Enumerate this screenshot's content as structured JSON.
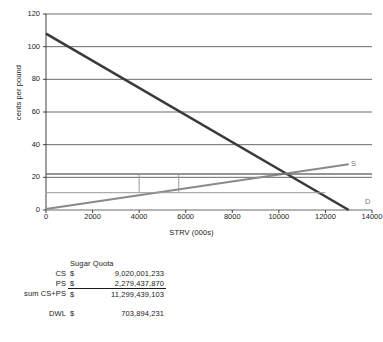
{
  "chart_data": {
    "type": "line",
    "title": "",
    "xlabel": "STRV (000s)",
    "ylabel": "cents per pound",
    "xlim": [
      0,
      14000
    ],
    "ylim": [
      0,
      120
    ],
    "xticks": [
      0,
      2000,
      4000,
      6000,
      8000,
      10000,
      12000,
      14000
    ],
    "yticks": [
      0,
      20,
      40,
      60,
      80,
      100,
      120
    ],
    "grid": "horizontal",
    "legend_position": "inline-right",
    "series": [
      {
        "name": "D",
        "label": "D",
        "color": "#3a3a3a",
        "width": 2.6,
        "points": [
          [
            0,
            108
          ],
          [
            13000,
            0
          ]
        ]
      },
      {
        "name": "S",
        "label": "S",
        "color": "#8a8a8a",
        "width": 2.2,
        "points": [
          [
            0,
            0.6
          ],
          [
            13000,
            28
          ]
        ]
      },
      {
        "name": "quota-price-line",
        "label": "",
        "color": "#707070",
        "width": 1.4,
        "points": [
          [
            0,
            22
          ],
          [
            14000,
            22
          ]
        ]
      },
      {
        "name": "quota-lower-line",
        "label": "",
        "color": "#9a9a9a",
        "width": 1.0,
        "points": [
          [
            0,
            10.6
          ],
          [
            12000,
            10.6
          ]
        ]
      },
      {
        "name": "quota-box-left",
        "label": "",
        "color": "#9a9a9a",
        "width": 1.0,
        "points": [
          [
            4000,
            10.6
          ],
          [
            4000,
            22
          ]
        ]
      },
      {
        "name": "quota-box-right",
        "label": "",
        "color": "#9a9a9a",
        "width": 1.0,
        "points": [
          [
            5700,
            10.6
          ],
          [
            5700,
            22
          ]
        ]
      }
    ],
    "annotations": [
      {
        "name": "supply-label",
        "text": "S",
        "x": 13100,
        "y": 28
      },
      {
        "name": "demand-label",
        "text": "D",
        "x": 13700,
        "y": 5
      }
    ]
  },
  "table": {
    "header": "Sugar Quota",
    "currency": "$",
    "rows": [
      {
        "label": "CS",
        "currency": "$",
        "value": "9,020,001,233",
        "total": false
      },
      {
        "label": "PS",
        "currency": "$",
        "value": "2,279,437,870",
        "total": false
      },
      {
        "label": "sum CS+PS",
        "currency": "$",
        "value": "11,299,439,103",
        "total": true
      },
      {
        "label": "DWL",
        "currency": "$",
        "value": "703,894,231",
        "total": false,
        "spaced": true
      }
    ]
  }
}
